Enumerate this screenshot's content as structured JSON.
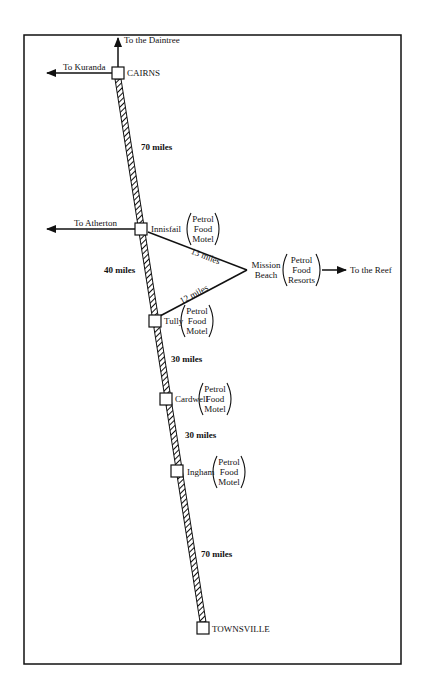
{
  "diagram": {
    "colors": {
      "ink": "#111111",
      "background": "#ffffff"
    },
    "towns": [
      {
        "name": "CAIRNS",
        "services": []
      },
      {
        "name": "Innisfail",
        "services": [
          "Petrol",
          "Food",
          "Motel"
        ]
      },
      {
        "name": "Tully",
        "services": [
          "Petrol",
          "Food",
          "Motel"
        ]
      },
      {
        "name": "Cardwell",
        "services": [
          "Petrol",
          "Food",
          "Motel"
        ]
      },
      {
        "name": "Ingham",
        "services": [
          "Petrol",
          "Food",
          "Motel"
        ]
      },
      {
        "name": "TOWNSVILLE",
        "services": []
      }
    ],
    "side_destination": {
      "name_line1": "Mission",
      "name_line2": "Beach",
      "services": [
        "Petrol",
        "Food",
        "Resorts"
      ]
    },
    "directions": {
      "daintree": "To the Daintree",
      "kuranda": "To Kuranda",
      "atherton": "To Atherton",
      "reef": "To the Reef"
    },
    "distances": {
      "cairns_innisfail": "70 miles",
      "innisfail_tully": "40 miles",
      "innisfail_mission": "13 miles",
      "mission_tully": "12 miles",
      "tully_cardwell": "30 miles",
      "cardwell_ingham": "30 miles",
      "ingham_townsville": "70 miles"
    }
  }
}
